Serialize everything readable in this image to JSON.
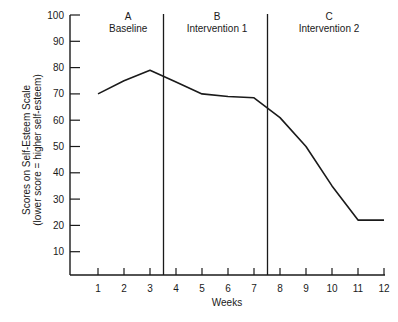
{
  "chart_data": {
    "type": "line",
    "title": "",
    "xlabel": "Weeks",
    "ylabel": "Scores on Self-Esteem Scale",
    "ylabel_sub": "(lower score = higher self-esteem)",
    "x": [
      1,
      2,
      3,
      4,
      5,
      6,
      7,
      8,
      9,
      10,
      11,
      12
    ],
    "series": [
      {
        "name": "Self-Esteem Score",
        "values": [
          70,
          75,
          79,
          74.5,
          70,
          69,
          68.5,
          61,
          50,
          35,
          22,
          22
        ]
      }
    ],
    "xticks": [
      "1",
      "2",
      "3",
      "4",
      "5",
      "6",
      "7",
      "8",
      "9",
      "10",
      "11",
      "12"
    ],
    "yticks": [
      "10",
      "20",
      "30",
      "40",
      "50",
      "60",
      "70",
      "80",
      "90",
      "100"
    ],
    "ylim": [
      0,
      100
    ],
    "xlim": [
      0,
      12
    ],
    "grid": false,
    "phase_lines_at": [
      3.5,
      7.5
    ],
    "phases": [
      {
        "letter": "A",
        "name": "Baseline"
      },
      {
        "letter": "B",
        "name": "Intervention 1"
      },
      {
        "letter": "C",
        "name": "Intervention 2"
      }
    ],
    "colors": {
      "line": "#1a1a1a",
      "axis": "#1a1a1a"
    }
  }
}
